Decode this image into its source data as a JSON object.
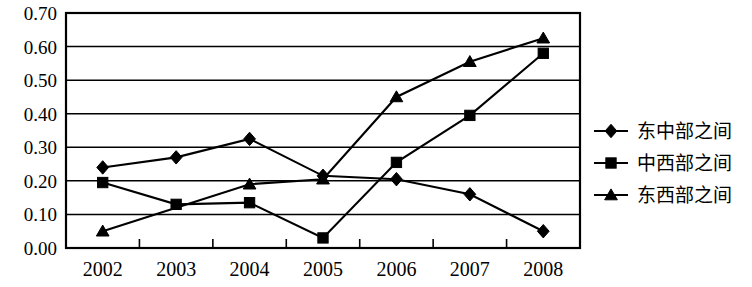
{
  "chart_data": {
    "type": "line",
    "title": "",
    "subtitle": "",
    "xlabel": "",
    "ylabel": "",
    "categories": [
      "2002",
      "2003",
      "2004",
      "2005",
      "2006",
      "2007",
      "2008"
    ],
    "ylim": [
      0.0,
      0.7
    ],
    "ytick_labels": [
      "0.70",
      "0.60",
      "0.50",
      "0.40",
      "0.30",
      "0.20",
      "0.10",
      "0.00"
    ],
    "ytick_values": [
      0.7,
      0.6,
      0.5,
      0.4,
      0.3,
      0.2,
      0.1,
      0.0
    ],
    "grid": "horizontal",
    "legend_position": "right",
    "series": [
      {
        "name": "东中部之间",
        "marker": "diamond",
        "values": [
          0.24,
          0.27,
          0.325,
          0.215,
          0.205,
          0.16,
          0.05
        ]
      },
      {
        "name": "中西部之间",
        "marker": "square",
        "values": [
          0.195,
          0.13,
          0.135,
          0.03,
          0.255,
          0.395,
          0.58
        ]
      },
      {
        "name": "东西部之间",
        "marker": "triangle",
        "values": [
          0.05,
          null,
          0.19,
          0.205,
          0.45,
          0.555,
          0.625
        ]
      }
    ],
    "colors": {
      "axis": "#000000",
      "grid": "#000000",
      "series": [
        "#000000",
        "#000000",
        "#000000"
      ],
      "background": "#ffffff"
    }
  }
}
